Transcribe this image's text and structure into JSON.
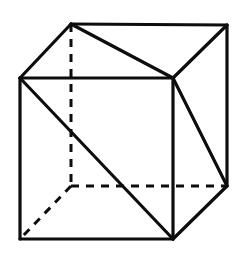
{
  "figure": {
    "type": "line-drawing",
    "canvas": {
      "width": 247,
      "height": 259,
      "background_color": "#ffffff"
    },
    "style": {
      "stroke_color": "#0d0d0d",
      "solid_stroke_width": 3.2,
      "dashed_stroke_width": 3.0,
      "dash_pattern": "8 7"
    },
    "vertices": {
      "front_top_left": {
        "label": "FTL",
        "x": 20,
        "y": 78,
        "hidden": false
      },
      "front_top_right": {
        "label": "FTR",
        "x": 173,
        "y": 78,
        "hidden": false
      },
      "front_bottom_right": {
        "label": "FBR",
        "x": 173,
        "y": 239,
        "hidden": false
      },
      "front_bottom_left": {
        "label": "FBL",
        "x": 20,
        "y": 239,
        "hidden": false
      },
      "back_top_left": {
        "label": "BTL",
        "x": 71,
        "y": 24,
        "hidden": false
      },
      "back_top_right": {
        "label": "BTR",
        "x": 227,
        "y": 25,
        "hidden": false
      },
      "back_bottom_right": {
        "label": "BBR",
        "x": 227,
        "y": 186,
        "hidden": false
      },
      "back_bottom_left": {
        "label": "BBL",
        "x": 71,
        "y": 186,
        "hidden": true
      }
    },
    "edges_solid": [
      {
        "name": "front-top-edge",
        "from": "FTL",
        "to": "FTR",
        "x1": 20,
        "y1": 78,
        "x2": 173,
        "y2": 78
      },
      {
        "name": "front-right-edge",
        "from": "FTR",
        "to": "FBR",
        "x1": 173,
        "y1": 78,
        "x2": 173,
        "y2": 239
      },
      {
        "name": "front-bottom-edge",
        "from": "FBR",
        "to": "FBL",
        "x1": 173,
        "y1": 239,
        "x2": 20,
        "y2": 239
      },
      {
        "name": "front-left-edge",
        "from": "FBL",
        "to": "FTL",
        "x1": 20,
        "y1": 239,
        "x2": 20,
        "y2": 78
      },
      {
        "name": "back-top-edge",
        "from": "BTL",
        "to": "BTR",
        "x1": 71,
        "y1": 24,
        "x2": 227,
        "y2": 25
      },
      {
        "name": "back-right-edge",
        "from": "BTR",
        "to": "BBR",
        "x1": 227,
        "y1": 25,
        "x2": 227,
        "y2": 186
      },
      {
        "name": "top-left-connector",
        "from": "FTL",
        "to": "BTL",
        "x1": 20,
        "y1": 78,
        "x2": 71,
        "y2": 24
      },
      {
        "name": "top-right-connector",
        "from": "FTR",
        "to": "BTR",
        "x1": 173,
        "y1": 78,
        "x2": 227,
        "y2": 25
      },
      {
        "name": "bottom-right-connector",
        "from": "FBR",
        "to": "BBR",
        "x1": 173,
        "y1": 239,
        "x2": 227,
        "y2": 186
      }
    ],
    "edges_hidden_dashed": [
      {
        "name": "back-left-vertical-edge",
        "from": "BTL",
        "to": "BBL",
        "x1": 71,
        "y1": 24,
        "x2": 71,
        "y2": 186
      },
      {
        "name": "back-bottom-edge",
        "from": "BBL",
        "to": "BBR",
        "x1": 71,
        "y1": 186,
        "x2": 227,
        "y2": 186
      },
      {
        "name": "bottom-left-connector",
        "from": "BBL",
        "to": "FBL",
        "x1": 71,
        "y1": 186,
        "x2": 20,
        "y2": 239
      }
    ],
    "diagonals": [
      {
        "name": "top-face-diagonal",
        "face": "top",
        "from": "BTL",
        "to": "FTR",
        "x1": 71,
        "y1": 24,
        "x2": 173,
        "y2": 78
      },
      {
        "name": "front-face-diagonal",
        "face": "front",
        "from": "FTL",
        "to": "FBR",
        "x1": 20,
        "y1": 78,
        "x2": 173,
        "y2": 239
      },
      {
        "name": "right-face-diagonal",
        "face": "right",
        "from": "FTR",
        "to": "BBR",
        "x1": 173,
        "y1": 78,
        "x2": 227,
        "y2": 186
      }
    ]
  }
}
